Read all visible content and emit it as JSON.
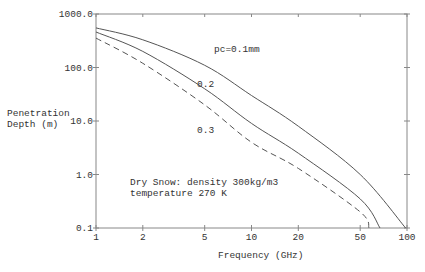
{
  "chart_data": {
    "type": "line",
    "title": "",
    "xlabel": "Frequency (GHz)",
    "ylabel": "Penetration Depth (m)",
    "ylabel_lines": [
      "Penetration",
      "Depth (m)"
    ],
    "xscale": "log",
    "yscale": "log",
    "xlim": [
      1,
      100
    ],
    "ylim": [
      0.1,
      1000
    ],
    "x_ticks": [
      1,
      2,
      5,
      10,
      20,
      50,
      100
    ],
    "x_tick_labels": [
      "1",
      "2",
      "5",
      "10",
      "20",
      "50",
      "100"
    ],
    "y_ticks": [
      0.1,
      1,
      10,
      100,
      1000
    ],
    "y_tick_labels": [
      "0.1",
      "1.0",
      "10.0",
      "100.0",
      "1000.0"
    ],
    "grid": false,
    "series": [
      {
        "name": "pc=0.1mm",
        "label": "pc=0.1mm",
        "style": "solid",
        "x": [
          1,
          2,
          5,
          10,
          20,
          50,
          98
        ],
        "y": [
          550,
          330,
          110,
          30,
          8,
          1.0,
          0.1
        ]
      },
      {
        "name": "0.2",
        "label": "0.2",
        "style": "solid",
        "x": [
          1,
          2,
          5,
          10,
          20,
          50,
          67
        ],
        "y": [
          460,
          200,
          40,
          9,
          2.5,
          0.35,
          0.1
        ]
      },
      {
        "name": "0.3",
        "label": "0.3",
        "style": "dashed",
        "x": [
          1,
          2,
          5,
          10,
          20,
          50,
          57
        ],
        "y": [
          355,
          120,
          20,
          4,
          1.3,
          0.2,
          0.1
        ]
      }
    ],
    "annotations": [
      "Dry Snow: density 300kg/m3",
      "temperature 270 K"
    ]
  }
}
